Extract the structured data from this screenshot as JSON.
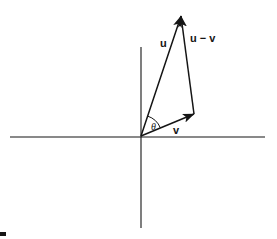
{
  "figure": {
    "kind": "vector-triangle-diagram",
    "width": 277,
    "height": 239,
    "background_color": "#ffffff",
    "stroke_color": "#151515"
  },
  "axes": {
    "x_axis": {
      "name": "horizontal-axis",
      "x1": 10,
      "y1": 137,
      "x2": 265,
      "y2": 137
    },
    "y_axis": {
      "name": "vertical-axis",
      "x1": 141,
      "y1": 47,
      "x2": 141,
      "y2": 228
    },
    "origin": {
      "x": 141,
      "y": 136
    }
  },
  "vectors": {
    "u": {
      "label": "u",
      "label_x": 160,
      "label_y": 47,
      "from_x": 141,
      "from_y": 136,
      "to_x": 181,
      "to_y": 16
    },
    "v": {
      "label": "v",
      "label_x": 173,
      "label_y": 134,
      "from_x": 141,
      "from_y": 136,
      "to_x": 194,
      "to_y": 114
    },
    "u_minus_v": {
      "label": "u − v",
      "label_x": 190,
      "label_y": 42,
      "from_x": 194,
      "from_y": 114,
      "to_x": 181,
      "to_y": 16
    }
  },
  "angle": {
    "label": "θ",
    "label_x": 151,
    "label_y": 130,
    "arc_radius": 21,
    "vertex_x": 141,
    "vertex_y": 136
  },
  "corner_mark": {
    "name": "page-corner-mark",
    "x": 0,
    "y": 232,
    "width": 6,
    "height": 4
  }
}
